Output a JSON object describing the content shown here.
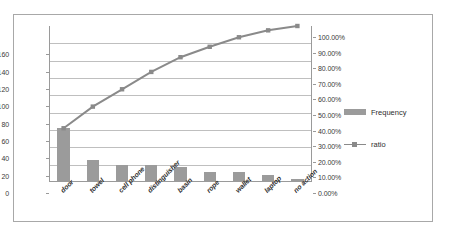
{
  "chart_data": {
    "type": "bar",
    "title": "",
    "subtitle": "",
    "xlabel": "",
    "ylabel": "",
    "categories": [
      "door",
      "towel",
      "cell phone",
      "distinguisher",
      "basin",
      "rope",
      "wallet",
      "laptop",
      "no action"
    ],
    "series": [
      {
        "name": "Frequency",
        "type": "bar",
        "axis": "left",
        "values": [
          62,
          25,
          20,
          20,
          17,
          12,
          11,
          8,
          3
        ]
      },
      {
        "name": "ratio",
        "type": "line",
        "axis": "right",
        "values": [
          0.3444,
          0.4833,
          0.5944,
          0.7056,
          0.8,
          0.8667,
          0.9278,
          0.9722,
          1.0
        ]
      }
    ],
    "left_axis": {
      "ticks": [
        0,
        20,
        40,
        60,
        80,
        100,
        120,
        140,
        160
      ],
      "tick_labels": [
        "0",
        "20",
        "40",
        "60",
        "80",
        "100",
        "120",
        "140",
        "160"
      ],
      "ylim": [
        0,
        180
      ]
    },
    "right_axis": {
      "ticks": [
        0,
        10,
        20,
        30,
        40,
        50,
        60,
        70,
        80,
        90,
        100
      ],
      "tick_labels": [
        "0.00%",
        "10.00%",
        "20.00%",
        "30.00%",
        "40.00%",
        "50.00%",
        "60.00%",
        "70.00%",
        "80.00%",
        "90.00%",
        "100.00%"
      ],
      "ylim": [
        0,
        100
      ]
    },
    "grid": true,
    "legend_position": "right",
    "legend": [
      {
        "label": "Frequency",
        "marker": "bar-swatch",
        "color": "#9b9b9b"
      },
      {
        "label": "ratio",
        "marker": "line-square",
        "color": "#8a8a8a"
      }
    ],
    "colors": {
      "bar": "#9b9b9b",
      "line": "#8a8a8a",
      "gridline": "#bfbfbf",
      "axis": "#9a9a9a",
      "frame": "#a8a8a8",
      "text": "#2e2e2e"
    }
  }
}
